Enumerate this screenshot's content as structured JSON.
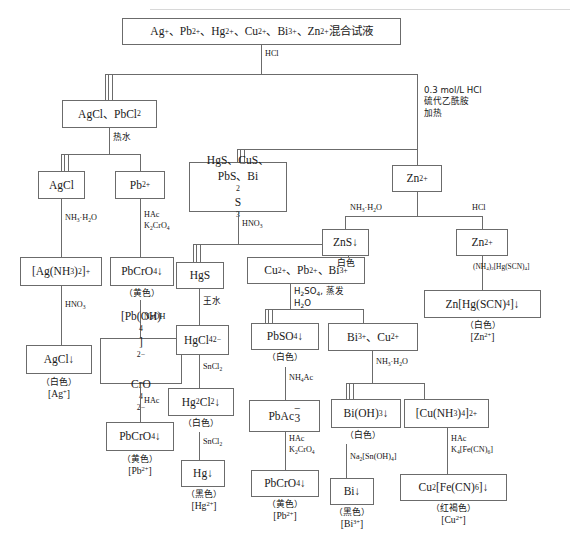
{
  "boxes": {
    "root": "Ag<sup>+</sup>、Pb<sup>2+</sup>、Hg<sup>2+</sup>、Cu<sup>2+</sup>、Bi<sup>3+</sup>、Zn<sup>2+</sup>混合试液",
    "agcl_pbcl2": "AgCl、PbCl<sub>2</sub>",
    "agcl": "AgCl",
    "pb2": "Pb<sup>2+</sup>",
    "ag_nh3_2": "[Ag(NH<sub>3</sub>)<sub>2</sub>]<sup>+</sup>",
    "pbcro4_a": "PbCrO<sub>4</sub><span class=\"arrow\">↓</span>",
    "agcl_ppt": "AgCl<span class=\"arrow\">↓</span>",
    "pb_oh_4": "[Pb(OH)<sub>4</sub>]<sup>2−</sup><br>CrO<sub>4</sub><sup>2−</sup>",
    "pbcro4_b": "PbCrO<sub>4</sub><span class=\"arrow\">↓</span>",
    "sulfides": "HgS、CuS、<br>PbS、Bi<sub>2</sub>S<sub>3</sub>",
    "hgs": "HgS",
    "cu_pb_bi": "Cu<sup>2+</sup>、Pb<sup>2+</sup>、Bi<sup>3+</sup>",
    "hgcl4": "HgCl<sub>4</sub><sup>2−</sup>",
    "hg2cl2": "Hg<sub>2</sub>Cl<sub>2</sub><span class=\"arrow\">↓</span>",
    "hg": "Hg<span class=\"arrow\">↓</span>",
    "pbso4": "PbSO<sub>4</sub><span class=\"arrow\">↓</span>",
    "pbac3": "PbAc<span style=\"display:inline-block;text-align:center\"><span style=\"display:block;line-height:.3em\">−</span><span style=\"display:block\">3</span></span>",
    "pbcro4_c": "PbCrO<sub>4</sub><span class=\"arrow\">↓</span>",
    "bi_cu": "Bi<sup>3+</sup>、Cu<sup>2+</sup>",
    "bi_oh_3": "Bi(OH)<sub>3</sub><span class=\"arrow\">↓</span>",
    "cu_nh3_4": "[Cu(NH<sub>3</sub>)<sub>4</sub>]<sup>2+</sup>",
    "bi": "Bi<span class=\"arrow\">↓</span>",
    "cu2_fecn6": "Cu<sub>2</sub>[Fe(CN)<sub>6</sub>] <span class=\"arrow\">↓</span>",
    "zn2_top": "Zn<sup>2+</sup>",
    "zns": "ZnS<span class=\"arrow\">↓</span>",
    "zn2_right": "Zn<sup>2+</sup>",
    "zn_hgscn4": "Zn[Hg(SCN)<sub>4</sub>]<span class=\"arrow\">↓</span>"
  },
  "reagents": {
    "hcl_root": "HCl",
    "group2": "0.3 mol/L HCl<br>硫代乙酰胺<br>加热",
    "hot_water": "热水",
    "nh3_h2o_ag": "NH<sub>3</sub>·H<sub>2</sub>O",
    "hac_k2cro4_pb": "HAc<br>K<sub>2</sub>CrO<sub>4</sub>",
    "hno3_ag": "HNO<sub>3</sub>",
    "naoh": "NaOH",
    "hac_pb": "HAc",
    "hno3_sulfide": "HNO<sub>3</sub>",
    "aqua_regia": "王水",
    "h2so4_evap": "H<sub>2</sub>SO<sub>4</sub>, 蒸发<br>H<sub>2</sub>O",
    "sncl2_1": "SnCl<sub>2</sub>",
    "sncl2_2": "SnCl<sub>2</sub>",
    "nh4ac": "NH<sub>4</sub>Ac",
    "hac_k2cro4_2": "HAc<br>K<sub>2</sub>CrO<sub>4</sub>",
    "nh3_h2o_bi": "NH<sub>3</sub>·H<sub>2</sub>O",
    "na2_sn_oh_4": "Na<sub>2</sub>[Sn(OH)<sub>4</sub>]",
    "hac_k4fecn6": "HAc<br>K<sub>4</sub>[Fe(CN)<sub>6</sub>]",
    "nh3_h2o_zn": "NH<sub>3</sub>·H<sub>2</sub>O",
    "hcl_zn": "HCl",
    "nh4_2_hgscn4": "(NH<sub>4</sub>)<sub>2</sub>[Hg(SCN)<sub>4</sub>]"
  },
  "results": {
    "agcl_ppt": {
      "color": "（白色）",
      "ion": "[Ag<sup>+</sup>]"
    },
    "pbcro4_a": {
      "color": "（黄色）",
      "ion": ""
    },
    "pbcro4_b": {
      "color": "（黄色）",
      "ion": "[Pb<sup>2+</sup>]"
    },
    "hg2cl2": {
      "color": "（白色）",
      "ion": ""
    },
    "hg": {
      "color": "（黑色）",
      "ion": "[Hg<sup>2+</sup>]"
    },
    "pbso4": {
      "color": "（白色）",
      "ion": ""
    },
    "pbcro4_c": {
      "color": "（黄色）",
      "ion": "[Pb<sup>2+</sup>]"
    },
    "bi_oh_3": {
      "color": "（白色）",
      "ion": ""
    },
    "bi": {
      "color": "（黑色）",
      "ion": "[Bi<sup>3+</sup>]"
    },
    "cu2_fecn6": {
      "color": "（红褐色）",
      "ion": "[Cu<sup>2+</sup>]"
    },
    "zns": {
      "color": "白色",
      "ion": ""
    },
    "zn_hgscn4": {
      "color": "（白色）",
      "ion": "[Zn<sup>2+</sup>]"
    }
  },
  "colors": {
    "line": "#6b6b6b",
    "text": "#1a1a1a",
    "background": "#ffffff"
  }
}
